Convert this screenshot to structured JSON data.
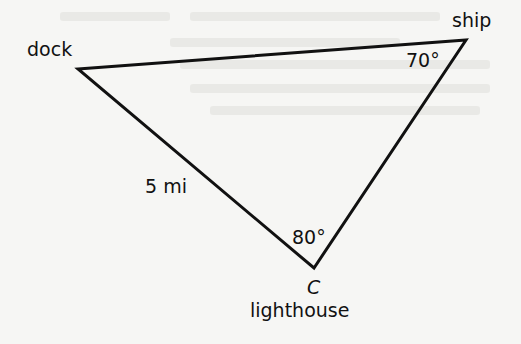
{
  "diagram": {
    "type": "triangle",
    "vertices": {
      "dock": {
        "label": "dock",
        "x": 78,
        "y": 69
      },
      "ship": {
        "label": "ship",
        "x": 466,
        "y": 40
      },
      "lighthouse": {
        "label": "lighthouse",
        "point_name": "C",
        "x": 314,
        "y": 268
      }
    },
    "angles": {
      "ship": "70°",
      "lighthouse": "80°"
    },
    "sides": {
      "dock_to_lighthouse": "5 mi"
    },
    "colors": {
      "line": "#111111",
      "background": "#f6f6f4"
    }
  }
}
